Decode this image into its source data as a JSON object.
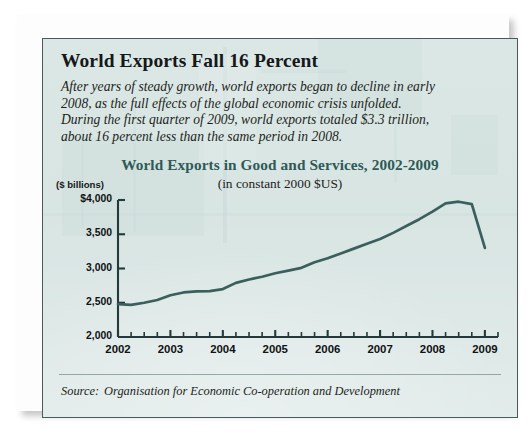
{
  "headline": "World Exports Fall 16 Percent",
  "deck_lines": [
    "After years of steady growth, world exports began to decline in early",
    "2008, as the full effects of the global economic crisis unfolded.",
    "During the first quarter of 2009, world exports totaled $3.3 trillion,",
    "about 16 percent less than the same period in 2008."
  ],
  "source": {
    "label": "Source:",
    "text": "Organisation for Economic Co-operation and Development"
  },
  "colors": {
    "panel_background": "#d9e6e4",
    "panel_border": "#4a5a5c",
    "title_teal": "#2e5a57",
    "line_teal": "#3a5f5c",
    "text_black": "#16181a"
  },
  "chart_data": {
    "type": "line",
    "title": "World Exports in Good and Services, 2002-2009",
    "subtitle": "(in constant 2000 $US)",
    "ylabel": "($ billions)",
    "xlabel": "",
    "ylim": [
      2000,
      4000
    ],
    "xlim": [
      2002,
      2009.25
    ],
    "grid": false,
    "legend": "none",
    "y_ticks": [
      "$4,000",
      "3,500",
      "3,000",
      "2,500",
      "2,000"
    ],
    "y_tick_values": [
      4000,
      3500,
      3000,
      2500,
      2000
    ],
    "x_ticks": [
      "2002",
      "2003",
      "2004",
      "2005",
      "2006",
      "2007",
      "2008",
      "2009"
    ],
    "x_tick_values": [
      2002,
      2003,
      2004,
      2005,
      2006,
      2007,
      2008,
      2009
    ],
    "x_minor_interval": 0.25,
    "series": [
      {
        "name": "World exports in goods and services",
        "x": [
          2002.0,
          2002.25,
          2002.5,
          2002.75,
          2003.0,
          2003.25,
          2003.5,
          2003.75,
          2004.0,
          2004.25,
          2004.5,
          2004.75,
          2005.0,
          2005.25,
          2005.5,
          2005.75,
          2006.0,
          2006.25,
          2006.5,
          2006.75,
          2007.0,
          2007.25,
          2007.5,
          2007.75,
          2008.0,
          2008.25,
          2008.5,
          2008.75,
          2009.0
        ],
        "values": [
          2480,
          2470,
          2500,
          2540,
          2610,
          2650,
          2665,
          2670,
          2700,
          2790,
          2840,
          2880,
          2930,
          2970,
          3010,
          3090,
          3150,
          3220,
          3290,
          3360,
          3430,
          3520,
          3620,
          3720,
          3830,
          3950,
          3975,
          3940,
          3300
        ]
      }
    ]
  }
}
